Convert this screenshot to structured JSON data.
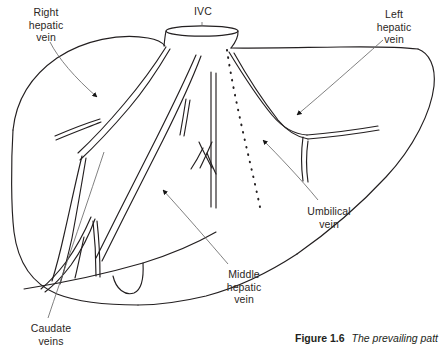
{
  "figure": {
    "caption_number": "Figure 1.6",
    "caption_text": "The prevailing patt",
    "background_color": "#ffffff",
    "ink_color": "#231f20",
    "leader_color": "#5b5b5b"
  },
  "labels": {
    "right_hepatic_vein": "Right\nhepatic\nvein",
    "ivc": "IVC",
    "left_hepatic_vein": "Left\nhepatic\nvein",
    "umbilical_vein": "Umbilical\nvein",
    "middle_hepatic_vein": "Middle\nhepatic\nvein",
    "caudate_veins": "Caudate\nveins"
  },
  "diagram": {
    "structures": [
      "liver-outline",
      "inferior-vena-cava-stump",
      "right-hepatic-vein-trunk",
      "middle-hepatic-vein-trunk",
      "left-hepatic-vein-trunk",
      "caudate-vein-branches",
      "umbilical-fissure-dotted-line",
      "gallbladder-fossa-notch"
    ],
    "annotation_arrows": 5,
    "leader_lines": 6
  }
}
